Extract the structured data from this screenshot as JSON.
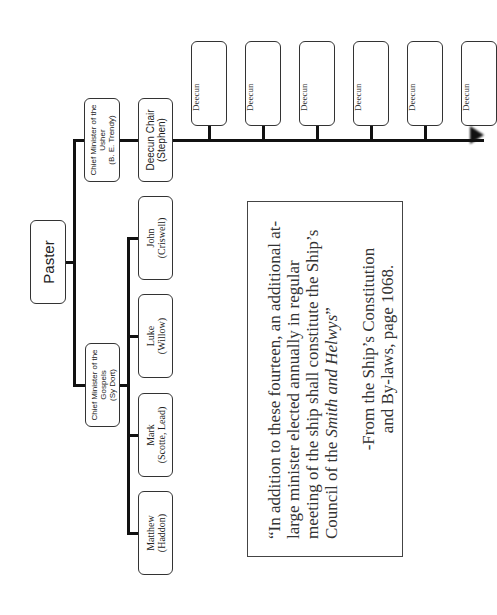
{
  "chart": {
    "root": {
      "label": "Paster"
    },
    "usher": {
      "title": "Chief Minister of the",
      "title2": "Usher",
      "name": "(B. E. Trendy)"
    },
    "deecun_chair": {
      "title": "Deecun Chair",
      "name": "(Stephen)"
    },
    "deecuns": [
      "Deecun",
      "Deecun",
      "Deecun",
      "Deecun",
      "Deecun",
      "Deecun"
    ],
    "gospels": {
      "title": "Chief Minister of the",
      "title2": "Gospels",
      "name": "(Sy Dort)"
    },
    "evangelists": [
      {
        "name": "John",
        "person": "(Criswell)"
      },
      {
        "name": "Luke",
        "person": "(Willow)"
      },
      {
        "name": "Mark",
        "person": "(Scotte, Lead)"
      },
      {
        "name": "Matthew",
        "person": "(Haddon)"
      }
    ]
  },
  "quote": {
    "text": "“In addition to these fourteen, an additional at-large minister elected annually in regular meeting of the ship shall constitute the Ship’s Council of the ",
    "italic": "Smith and Helwys",
    "close": "”",
    "source_line1": "-From the Ship’s Constitution",
    "source_line2": "and By-laws, page 1068."
  }
}
